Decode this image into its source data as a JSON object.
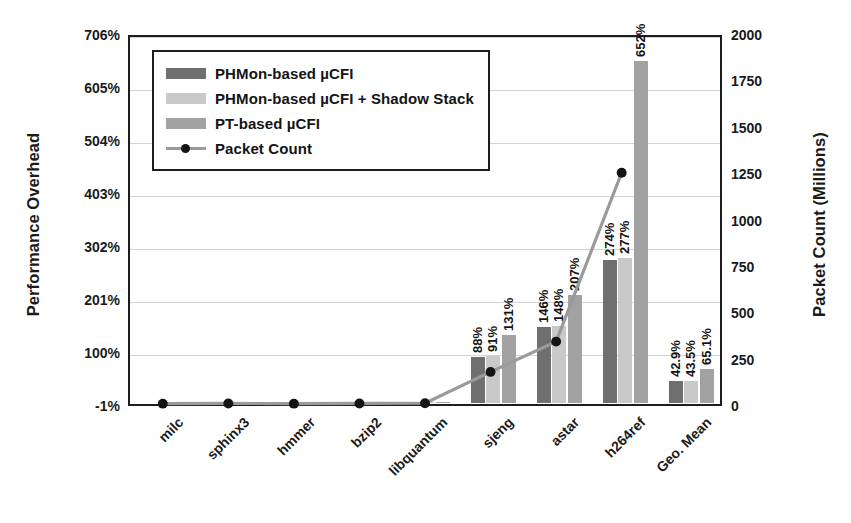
{
  "chart_data": {
    "type": "bar",
    "title": "",
    "categories": [
      "milc",
      "sphinx3",
      "hmmer",
      "bzip2",
      "libquantum",
      "sjeng",
      "astar",
      "h264ref",
      "Geo. Mean"
    ],
    "series": [
      {
        "name": "PHMon-based  µCFI",
        "color": "#6f6f6f",
        "axis": "left",
        "values": [
          0,
          0,
          0,
          0,
          0,
          88,
          146,
          274,
          42.9
        ],
        "labels": [
          "",
          "",
          "",
          "",
          "",
          "88%",
          "146%",
          "274%",
          "42.9%"
        ]
      },
      {
        "name": "PHMon-based  µCFI + Shadow Stack",
        "color": "#c9c9c9",
        "axis": "left",
        "values": [
          0,
          1,
          0,
          1,
          1,
          91,
          148,
          277,
          43.5
        ],
        "labels": [
          "",
          "",
          "",
          "",
          "",
          "91%",
          "148%",
          "277%",
          "43.5%"
        ]
      },
      {
        "name": "PT-based  µCFI",
        "color": "#a2a2a2",
        "axis": "left",
        "values": [
          0,
          2,
          0,
          2,
          3,
          131,
          207,
          652,
          65.1
        ],
        "labels": [
          "",
          "",
          "",
          "",
          "",
          "131%",
          "207%",
          "652%",
          "65.1%"
        ]
      },
      {
        "name": "Packet Count",
        "color": "#9a9a9a",
        "marker_color": "#141414",
        "axis": "right",
        "type": "line",
        "values": [
          2,
          3,
          2,
          3,
          4,
          175,
          340,
          1260,
          null
        ]
      }
    ],
    "xlabel": "",
    "ylabel": "Performance Overhead",
    "ylabel_right": "Packet Count (Millions)",
    "ylim": [
      -1,
      706
    ],
    "ylim_right": [
      0,
      2000
    ],
    "yticks_left": [
      "-1%",
      "100%",
      "201%",
      "302%",
      "403%",
      "504%",
      "605%",
      "706%"
    ],
    "yticks_left_values": [
      -1,
      100,
      201,
      302,
      403,
      504,
      605,
      706
    ],
    "yticks_right": [
      "0",
      "250",
      "500",
      "750",
      "1000",
      "1250",
      "1500",
      "1750",
      "2000"
    ],
    "yticks_right_values": [
      0,
      250,
      500,
      750,
      1000,
      1250,
      1500,
      1750,
      2000
    ],
    "grid": true,
    "legend_position": "upper left"
  },
  "legend": {
    "items": [
      {
        "label": "PHMon-based  µCFI",
        "style": "s0"
      },
      {
        "label": "PHMon-based  µCFI + Shadow Stack",
        "style": "s1"
      },
      {
        "label": "PT-based  µCFI",
        "style": "s2"
      },
      {
        "label": "Packet Count",
        "style": "line"
      }
    ]
  },
  "axes": {
    "left_title": "Performance Overhead",
    "right_title": "Packet Count (Millions)"
  }
}
